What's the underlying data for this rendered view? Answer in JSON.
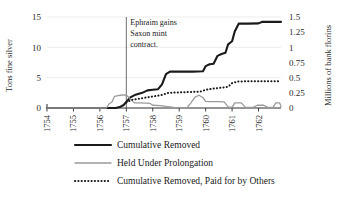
{
  "chart_data": {
    "type": "line",
    "title": "",
    "xlabel": "",
    "ylabel": "Tons fine silver",
    "y2label": "Millions of bank florins",
    "xlim": [
      1754,
      1762.85
    ],
    "ylim": [
      0,
      15
    ],
    "y2lim": [
      0,
      1.5
    ],
    "grid": "horizontal-faint",
    "legend_position": "bottom",
    "xticks": [
      "1754",
      "1755",
      "1756",
      "1757",
      "1758",
      "1759",
      "1760",
      "1761",
      "1762"
    ],
    "xtick_values": [
      1754,
      1755,
      1756,
      1757,
      1758,
      1759,
      1760,
      1761,
      1762
    ],
    "yticks": [
      "0",
      "5",
      "10",
      "15"
    ],
    "ytick_values": [
      0,
      5,
      10,
      15
    ],
    "y2ticks": [
      "0",
      "0.25",
      "0.5",
      "0.75",
      "1",
      "1.25",
      "1.5"
    ],
    "y2tick_values": [
      0,
      0.25,
      0.5,
      0.75,
      1,
      1.25,
      1.5
    ],
    "annotations": [
      {
        "name": "ephraim-note",
        "lines": [
          "Ephraim gains",
          "Saxon mint",
          "contract."
        ],
        "x": 1757,
        "line_from_y": 15,
        "line_to_y": 0
      }
    ],
    "series": [
      {
        "name": "Cumulative Removed",
        "style": "solid-thick",
        "color": "#1a1a1a",
        "axis": "left",
        "points": [
          [
            1754.0,
            0
          ],
          [
            1756.6,
            0
          ],
          [
            1756.75,
            0.15
          ],
          [
            1756.9,
            0.5
          ],
          [
            1757.0,
            1.0
          ],
          [
            1757.15,
            1.75
          ],
          [
            1757.35,
            2.2
          ],
          [
            1757.6,
            2.5
          ],
          [
            1757.8,
            2.9
          ],
          [
            1758.0,
            3.0
          ],
          [
            1758.2,
            3.1
          ],
          [
            1758.35,
            3.9
          ],
          [
            1758.5,
            5.6
          ],
          [
            1758.65,
            6.0
          ],
          [
            1759.0,
            6.0
          ],
          [
            1759.5,
            6.0
          ],
          [
            1759.9,
            6.05
          ],
          [
            1760.0,
            6.9
          ],
          [
            1760.15,
            7.2
          ],
          [
            1760.3,
            7.3
          ],
          [
            1760.45,
            8.6
          ],
          [
            1760.6,
            8.9
          ],
          [
            1760.75,
            9.1
          ],
          [
            1760.85,
            10.5
          ],
          [
            1761.0,
            11.0
          ],
          [
            1761.1,
            12.6
          ],
          [
            1761.25,
            13.9
          ],
          [
            1761.6,
            13.9
          ],
          [
            1762.0,
            13.95
          ],
          [
            1762.15,
            14.2
          ],
          [
            1762.85,
            14.2
          ]
        ]
      },
      {
        "name": "Held Under Prolongation",
        "style": "solid-grey",
        "color": "#9a9a9a",
        "axis": "left",
        "points": [
          [
            1754.0,
            0
          ],
          [
            1756.25,
            0
          ],
          [
            1756.35,
            0.7
          ],
          [
            1756.45,
            0.95
          ],
          [
            1756.55,
            1.9
          ],
          [
            1756.75,
            2.1
          ],
          [
            1757.0,
            2.15
          ],
          [
            1757.15,
            1.5
          ],
          [
            1757.3,
            0.85
          ],
          [
            1757.5,
            0.85
          ],
          [
            1757.75,
            0.8
          ],
          [
            1757.9,
            0.75
          ],
          [
            1758.0,
            0.45
          ],
          [
            1758.3,
            0.4
          ],
          [
            1758.5,
            0.25
          ],
          [
            1758.8,
            0.1
          ],
          [
            1759.0,
            0.05
          ],
          [
            1759.3,
            0.05
          ],
          [
            1759.45,
            0.9
          ],
          [
            1759.6,
            1.8
          ],
          [
            1759.75,
            2.1
          ],
          [
            1759.9,
            1.7
          ],
          [
            1760.0,
            1.1
          ],
          [
            1760.15,
            1.05
          ],
          [
            1760.5,
            1.05
          ],
          [
            1760.7,
            1.0
          ],
          [
            1760.85,
            0.2
          ],
          [
            1761.0,
            0.1
          ],
          [
            1761.1,
            0.85
          ],
          [
            1761.35,
            0.85
          ],
          [
            1761.5,
            0.1
          ],
          [
            1761.8,
            0.1
          ],
          [
            1761.95,
            0.45
          ],
          [
            1762.2,
            0.45
          ],
          [
            1762.35,
            0.1
          ],
          [
            1762.55,
            0.1
          ],
          [
            1762.65,
            0.85
          ],
          [
            1762.8,
            0.85
          ],
          [
            1762.85,
            0.2
          ]
        ]
      },
      {
        "name": "Cumulative Removed, Paid for by Others",
        "style": "dotted",
        "color": "#1a1a1a",
        "axis": "left",
        "points": [
          [
            1757.0,
            0.9
          ],
          [
            1757.2,
            1.35
          ],
          [
            1757.45,
            1.5
          ],
          [
            1757.7,
            1.7
          ],
          [
            1758.0,
            1.9
          ],
          [
            1758.3,
            2.1
          ],
          [
            1758.6,
            2.5
          ],
          [
            1758.9,
            2.55
          ],
          [
            1759.2,
            2.6
          ],
          [
            1759.5,
            2.65
          ],
          [
            1759.8,
            2.7
          ],
          [
            1760.0,
            3.0
          ],
          [
            1760.3,
            3.2
          ],
          [
            1760.6,
            3.35
          ],
          [
            1760.85,
            3.5
          ],
          [
            1761.0,
            4.1
          ],
          [
            1761.2,
            4.35
          ],
          [
            1761.5,
            4.4
          ],
          [
            1762.0,
            4.4
          ],
          [
            1762.85,
            4.4
          ]
        ]
      }
    ],
    "legend": [
      {
        "label": "Cumulative Removed",
        "style": "solid-thick",
        "color": "#1a1a1a"
      },
      {
        "label": "Held Under Prolongation",
        "style": "solid-grey",
        "color": "#9a9a9a"
      },
      {
        "label": "Cumulative Removed, Paid for by Others",
        "style": "dotted",
        "color": "#1a1a1a"
      }
    ]
  }
}
